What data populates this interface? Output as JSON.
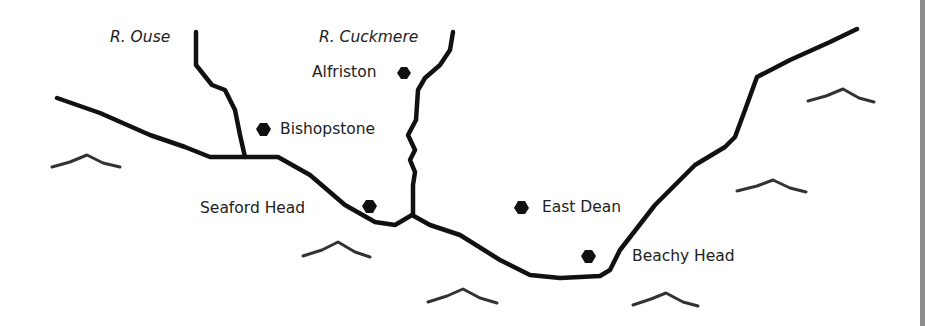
{
  "map": {
    "colors": {
      "line": "#111111",
      "wave": "#333333",
      "text": "#222222",
      "background": "#ffffff",
      "edge": "#8c8c8c"
    },
    "rivers": [
      {
        "name": "R. Ouse"
      },
      {
        "name": "R. Cuckmere"
      }
    ],
    "places": [
      {
        "name": "Alfriston"
      },
      {
        "name": "Bishopstone"
      },
      {
        "name": "Seaford Head"
      },
      {
        "name": "East Dean"
      },
      {
        "name": "Beachy Head"
      }
    ],
    "markers": {
      "icon": "place-dot-icon"
    },
    "sea_symbols": {
      "icon": "wave-icon",
      "count": 6
    }
  }
}
